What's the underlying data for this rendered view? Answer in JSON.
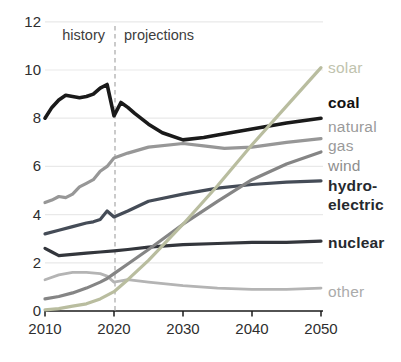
{
  "chart_data": {
    "type": "line",
    "title": "",
    "xlabel": "",
    "ylabel": "",
    "xlim": [
      2010,
      2050
    ],
    "ylim": [
      0,
      12
    ],
    "x_ticks": [
      "2010",
      "2020",
      "2030",
      "2040",
      "2050"
    ],
    "y_ticks": [
      "0",
      "2",
      "4",
      "6",
      "8",
      "10",
      "12"
    ],
    "grid": "horizontal",
    "gridline_color": "#e9e9e9",
    "axis_color": "#1a1a1a",
    "boundary": {
      "year": 2020,
      "style": "dashed",
      "line_color": "#b5b5b5",
      "left_label": "history",
      "right_label": "projections"
    },
    "legend_position": "right-of-lines",
    "series": [
      {
        "id": "other",
        "label": "other",
        "bold": false,
        "color": "#b4b4b4",
        "label_color": "#ababab",
        "width": 2.8,
        "x": [
          2010,
          2012,
          2014,
          2016,
          2018,
          2019,
          2020,
          2021,
          2022,
          2025,
          2030,
          2035,
          2040,
          2045,
          2050
        ],
        "values": [
          1.3,
          1.5,
          1.6,
          1.6,
          1.55,
          1.45,
          1.2,
          1.25,
          1.3,
          1.2,
          1.05,
          0.95,
          0.9,
          0.9,
          0.95
        ]
      },
      {
        "id": "nuclear",
        "label": "nuclear",
        "bold": true,
        "color": "#33363c",
        "label_color": "#26292e",
        "width": 3.2,
        "x": [
          2010,
          2011,
          2012,
          2014,
          2016,
          2018,
          2020,
          2022,
          2025,
          2030,
          2035,
          2040,
          2045,
          2050
        ],
        "values": [
          2.6,
          2.45,
          2.3,
          2.35,
          2.4,
          2.45,
          2.5,
          2.55,
          2.65,
          2.75,
          2.8,
          2.85,
          2.85,
          2.9
        ]
      },
      {
        "id": "hydroelectric",
        "label": "hydro-\nelectric",
        "bold": true,
        "color": "#454c57",
        "label_color": "#26292e",
        "width": 3.2,
        "x": [
          2010,
          2012,
          2014,
          2016,
          2017,
          2018,
          2019,
          2020,
          2022,
          2025,
          2030,
          2035,
          2040,
          2045,
          2050
        ],
        "values": [
          3.2,
          3.35,
          3.5,
          3.65,
          3.7,
          3.8,
          4.15,
          3.9,
          4.15,
          4.55,
          4.85,
          5.1,
          5.25,
          5.35,
          5.4
        ]
      },
      {
        "id": "natural_gas",
        "label": "natural\ngas",
        "bold": false,
        "color": "#979797",
        "label_color": "#9a9a9a",
        "width": 3.2,
        "x": [
          2010,
          2011,
          2012,
          2013,
          2014,
          2015,
          2016,
          2017,
          2018,
          2019,
          2020,
          2021,
          2022,
          2025,
          2030,
          2033,
          2036,
          2040,
          2045,
          2050
        ],
        "values": [
          4.5,
          4.6,
          4.75,
          4.7,
          4.85,
          5.15,
          5.3,
          5.45,
          5.8,
          6.0,
          6.35,
          6.45,
          6.55,
          6.8,
          6.95,
          6.85,
          6.75,
          6.8,
          7.0,
          7.15
        ]
      },
      {
        "id": "wind",
        "label": "wind",
        "bold": false,
        "color": "#858585",
        "label_color": "#8e8e8e",
        "width": 3.2,
        "x": [
          2010,
          2012,
          2014,
          2016,
          2018,
          2019,
          2020,
          2022,
          2025,
          2030,
          2035,
          2040,
          2045,
          2050
        ],
        "values": [
          0.5,
          0.6,
          0.75,
          0.95,
          1.2,
          1.35,
          1.55,
          1.95,
          2.55,
          3.6,
          4.55,
          5.45,
          6.1,
          6.6
        ]
      },
      {
        "id": "coal",
        "label": "coal",
        "bold": true,
        "color": "#1a1a1a",
        "label_color": "#111111",
        "width": 3.6,
        "x": [
          2010,
          2011,
          2012,
          2013,
          2014,
          2015,
          2016,
          2017,
          2018,
          2019,
          2020,
          2021,
          2022,
          2023,
          2025,
          2027,
          2030,
          2033,
          2035,
          2040,
          2045,
          2050
        ],
        "values": [
          8.0,
          8.45,
          8.75,
          8.95,
          8.9,
          8.85,
          8.9,
          9.0,
          9.25,
          9.4,
          8.1,
          8.65,
          8.45,
          8.2,
          7.75,
          7.4,
          7.1,
          7.2,
          7.3,
          7.55,
          7.8,
          8.0
        ]
      },
      {
        "id": "solar",
        "label": "solar",
        "bold": false,
        "color": "#b9bd9f",
        "label_color": "#c0c3ae",
        "width": 3.2,
        "x": [
          2010,
          2012,
          2014,
          2016,
          2018,
          2020,
          2022,
          2025,
          2030,
          2035,
          2040,
          2045,
          2050
        ],
        "values": [
          0.05,
          0.1,
          0.2,
          0.3,
          0.5,
          0.8,
          1.3,
          2.1,
          3.6,
          5.2,
          6.9,
          8.5,
          10.1
        ]
      }
    ]
  }
}
